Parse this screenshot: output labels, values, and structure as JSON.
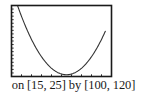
{
  "caption": "on [15, 25] by [100, 120]",
  "colors": {
    "frame": "#1a1a1a",
    "curve": "#333333",
    "background": "#ffffff"
  },
  "chart_data": {
    "type": "line",
    "title": "",
    "xlabel": "",
    "ylabel": "",
    "xlim": [
      15,
      25
    ],
    "ylim": [
      100,
      120
    ],
    "x_ticks_count": 10,
    "y_ticks_count": 20,
    "grid": false,
    "legend": null,
    "annotations": [
      "on [15, 25] by [100, 120]"
    ],
    "series": [
      {
        "name": "parabola",
        "x": [
          15.6,
          16,
          17,
          18,
          19,
          20,
          20.5,
          21,
          22,
          23,
          24,
          24.4
        ],
        "values": [
          120,
          117.2,
          111.3,
          106.6,
          103.0,
          100.8,
          100.5,
          100.8,
          103.0,
          106.6,
          111.3,
          113.5
        ]
      }
    ]
  }
}
